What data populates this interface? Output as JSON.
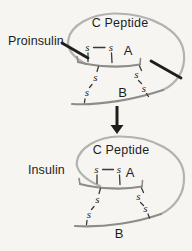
{
  "colors": {
    "background": "#f6f5f2",
    "loop": "#b3b2af",
    "chain": "#8d8c89",
    "ink": "#1e1e1e"
  },
  "proinsulin": {
    "name": "Proinsulin",
    "loop_label": "C Peptide",
    "a_label": "A",
    "b_label": "B",
    "s": "s"
  },
  "insulin": {
    "name": "Insulin",
    "loop_label": "C Peptide",
    "a_label": "A",
    "b_label": "B",
    "s": "s"
  }
}
